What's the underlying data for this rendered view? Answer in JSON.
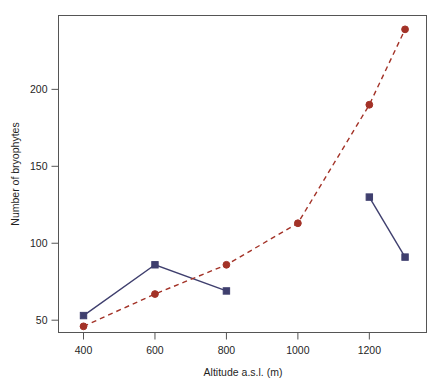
{
  "figure": {
    "title_partial": "",
    "background": "#ffffff",
    "frame_color": "#555555"
  },
  "chart_data": {
    "type": "line",
    "title": "",
    "xlabel": "Altitude a.s.l. (m)",
    "ylabel": "Number of bryophytes",
    "xlim": [
      330,
      1360
    ],
    "ylim": [
      42,
      248
    ],
    "xticks": [
      400,
      600,
      800,
      1000,
      1200
    ],
    "xticklabels": [
      "400",
      "600",
      "800",
      "1000",
      "1200"
    ],
    "yticks": [
      50,
      100,
      150,
      200
    ],
    "yticklabels": [
      "50",
      "100",
      "150",
      "200"
    ],
    "grid": false,
    "legend": "none",
    "series": [
      {
        "name": "blue-series",
        "color": "#3f3f6e",
        "linestyle": "solid",
        "marker": "square",
        "x": [
          400,
          600,
          800
        ],
        "y": [
          53,
          86,
          69
        ]
      },
      {
        "name": "blue-series-upper",
        "color": "#3f3f6e",
        "linestyle": "solid",
        "marker": "square",
        "x": [
          1200,
          1300
        ],
        "y": [
          130,
          91
        ]
      },
      {
        "name": "red-series",
        "color": "#a33227",
        "linestyle": "dashed",
        "marker": "circle",
        "x": [
          400,
          600,
          800,
          1000,
          1200,
          1300
        ],
        "y": [
          46,
          67,
          86,
          113,
          190,
          239
        ]
      }
    ]
  }
}
